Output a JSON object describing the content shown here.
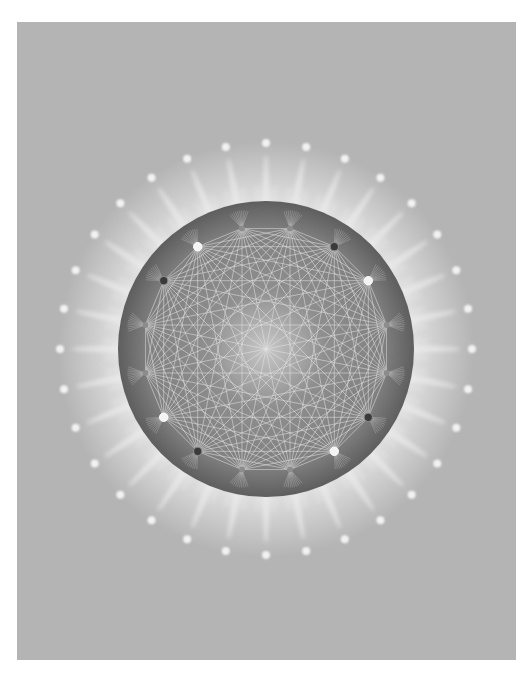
{
  "artwork": {
    "title": "Complete graph mandala",
    "background_color": "#b4b4b4",
    "page_color": "#ffffff",
    "panel": {
      "x": 17,
      "y": 22,
      "width": 499,
      "height": 638
    },
    "center": {
      "x": 266,
      "y": 349
    },
    "disc": {
      "radius": 148,
      "edge_color": "#5e5e5e",
      "mid_color": "#808080",
      "center_color": "#c8c8c8"
    },
    "graph": {
      "node_count": 16,
      "node_radius": 123,
      "line_color": "#e6e6e6",
      "nodes": [
        {
          "angle": -101.25,
          "type": "grey"
        },
        {
          "angle": -78.75,
          "type": "grey"
        },
        {
          "angle": -56.25,
          "type": "dark"
        },
        {
          "angle": -33.75,
          "type": "white"
        },
        {
          "angle": -11.25,
          "type": "grey"
        },
        {
          "angle": 11.25,
          "type": "grey"
        },
        {
          "angle": 33.75,
          "type": "dark"
        },
        {
          "angle": 56.25,
          "type": "white"
        },
        {
          "angle": 78.75,
          "type": "grey"
        },
        {
          "angle": 101.25,
          "type": "grey"
        },
        {
          "angle": 123.75,
          "type": "dark"
        },
        {
          "angle": 146.25,
          "type": "white"
        },
        {
          "angle": 168.75,
          "type": "grey"
        },
        {
          "angle": 191.25,
          "type": "grey"
        },
        {
          "angle": 213.75,
          "type": "dark"
        },
        {
          "angle": 236.25,
          "type": "white"
        }
      ],
      "node_colors": {
        "white": "#f4f4f4",
        "dark": "#3a3a3a",
        "grey": "#8c8c8c"
      }
    },
    "rays": {
      "count": 32,
      "inner_radius": 140,
      "outer_radius": 205,
      "dot_radius": 206,
      "dot_size": 4,
      "color": "#ececec"
    }
  }
}
